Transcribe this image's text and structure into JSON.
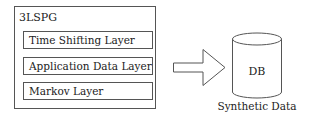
{
  "system": {
    "title": "3LSPG",
    "layers": [
      {
        "label": "Time Shifting Layer"
      },
      {
        "label": "Application Data Layer"
      },
      {
        "label": "Markov Layer"
      }
    ]
  },
  "arrow": {
    "direction": "right"
  },
  "database": {
    "label": "DB",
    "caption": "Synthetic Data"
  },
  "colors": {
    "stroke": "#555555",
    "background": "#ffffff",
    "text": "#222222"
  }
}
